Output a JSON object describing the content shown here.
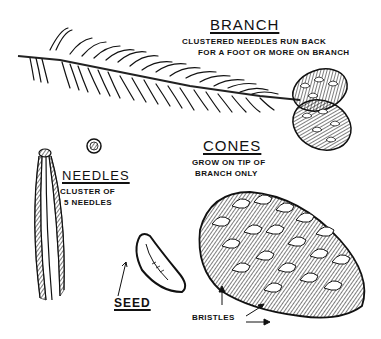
{
  "illustration": {
    "subject": "pine branch, needles, cones and seed",
    "colors": {
      "ink": "#111111",
      "paper": "#ffffff"
    }
  },
  "labels": {
    "branch": {
      "title": "BRANCH",
      "line1": "CLUSTERED NEEDLES RUN BACK",
      "line2": "FOR A FOOT OR MORE ON BRANCH"
    },
    "cones": {
      "title": "CONES",
      "line1": "GROW ON TIP OF",
      "line2": "BRANCH ONLY"
    },
    "needles": {
      "title": "NEEDLES",
      "line1": "CLUSTER OF",
      "line2": "5 NEEDLES"
    },
    "seed": {
      "title": "SEED"
    },
    "bristles": {
      "title": "BRISTLES"
    }
  }
}
